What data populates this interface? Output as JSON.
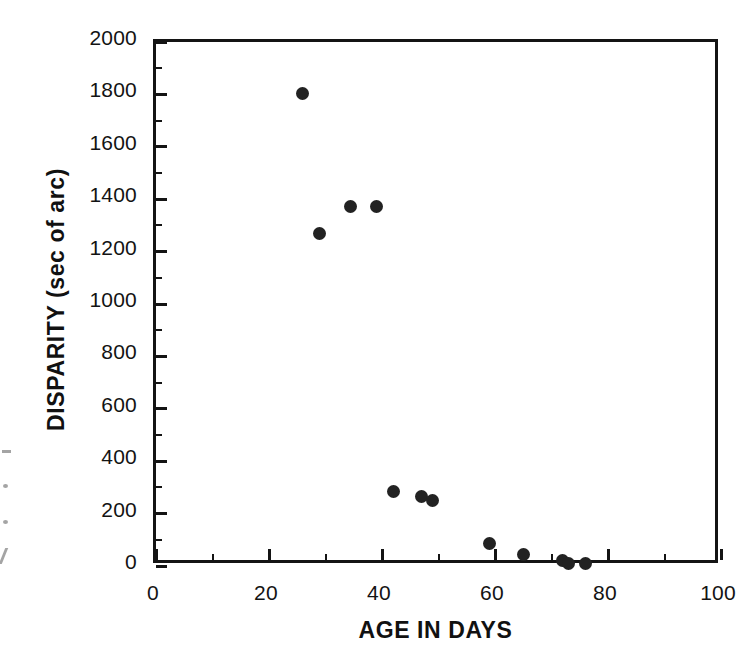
{
  "figure": {
    "background_color": "#ffffff",
    "ink_color": "#141414",
    "marker_color": "#222222"
  },
  "chart_data": {
    "type": "scatter",
    "title": "",
    "subtitle": "",
    "xlabel": "AGE IN DAYS",
    "ylabel": "DISPARITY (sec of arc)",
    "xlim": [
      0,
      100
    ],
    "ylim": [
      0,
      2000
    ],
    "x_major_ticks": [
      0,
      20,
      40,
      60,
      80,
      100
    ],
    "x_minor_tick_step": 10,
    "y_major_ticks": [
      0,
      200,
      400,
      600,
      800,
      1000,
      1200,
      1400,
      1600,
      1800,
      2000
    ],
    "y_minor_tick_step": 100,
    "x_tick_labels": [
      "0",
      "20",
      "40",
      "60",
      "80",
      "100"
    ],
    "y_tick_labels": [
      "0",
      "200",
      "400",
      "600",
      "800",
      "1000",
      "1200",
      "1400",
      "1600",
      "1800",
      "2000"
    ],
    "grid": false,
    "legend": null,
    "marker": "filled-circle",
    "series": [
      {
        "name": "disparity",
        "points": [
          {
            "x": 26,
            "y": 1805
          },
          {
            "x": 29,
            "y": 1270
          },
          {
            "x": 34.5,
            "y": 1372
          },
          {
            "x": 39,
            "y": 1372
          },
          {
            "x": 42,
            "y": 285
          },
          {
            "x": 47,
            "y": 265
          },
          {
            "x": 49,
            "y": 250
          },
          {
            "x": 59,
            "y": 85
          },
          {
            "x": 65,
            "y": 45
          },
          {
            "x": 72,
            "y": 20
          },
          {
            "x": 73,
            "y": 10
          },
          {
            "x": 76,
            "y": 10
          }
        ]
      }
    ]
  }
}
